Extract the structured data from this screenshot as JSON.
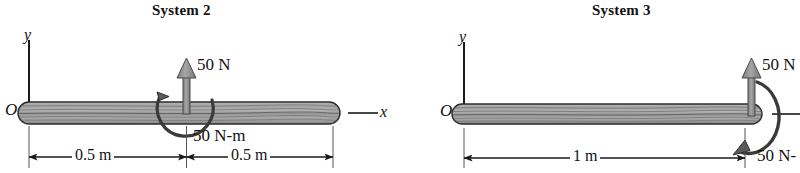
{
  "figure": {
    "background_color": "#ffffff",
    "ink_color": "#111111",
    "beam_fill_color": "#9a9a9a",
    "arrow_fill_color": "#8f8f8f"
  },
  "systems": [
    {
      "title": "System 2",
      "origin_label": "O",
      "y_axis_label": "y",
      "x_axis_label": "x",
      "force": {
        "label": "50 N",
        "direction": "up",
        "location": "midspan"
      },
      "moment": {
        "label": "50 N-m",
        "sense": "counterclockwise",
        "location": "midspan"
      },
      "dimensions": [
        {
          "label": "0.5 m"
        },
        {
          "label": "0.5 m"
        }
      ]
    },
    {
      "title": "System 3",
      "origin_label": "O",
      "y_axis_label": "y",
      "x_axis_label": "",
      "force": {
        "label": "50 N",
        "direction": "up",
        "location": "right-end"
      },
      "moment": {
        "label": "50 N-",
        "sense": "counterclockwise",
        "location": "right-end"
      },
      "dimensions": [
        {
          "label": "1 m"
        }
      ]
    }
  ]
}
